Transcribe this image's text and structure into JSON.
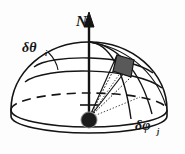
{
  "figure": {
    "background_color": "#fdfdfd",
    "stroke_color": "#141414",
    "patch_fill_color": "#595959",
    "origin_dot_color": "#1a1a1a",
    "origin_dot_ring_color": "#8c8c8c"
  },
  "labels": {
    "axis": {
      "name": "N",
      "text": "N",
      "description": "zenith / north axis arrow label"
    },
    "theta": {
      "symbol": "δθ",
      "subscript": "i",
      "text": "δθ",
      "sub_text": "i",
      "description": "polar-angle band width label, upper left"
    },
    "phi": {
      "symbol": "δφ",
      "subscript": "j",
      "text": "δφ",
      "sub_text": "j",
      "description": "azimuth-angle band width label, lower right"
    }
  },
  "geometry": {
    "dome": {
      "center_x": 89,
      "center_y": 110,
      "radius_x": 78,
      "radius_y": 68,
      "base_ellipse_ry": 17,
      "skirt_depth": 22
    },
    "axis": {
      "x": 89,
      "top_y": 14,
      "bottom_y": 112,
      "arrow_head_height": 13
    },
    "origin_dot": {
      "cx": 89,
      "cy": 120,
      "r": 7.5
    },
    "patch": {
      "points": "117,55 134,60 131,77 113,71",
      "description": "shaded solid angle element dΩ"
    }
  },
  "annotations": {
    "theta_leader": "leader line from δθ label to the latitude band",
    "phi_leader": "δφ label sits between two meridian lines near the rim",
    "rays": "solid and dotted rays from the origin dot to the four corners of the shaded patch"
  }
}
